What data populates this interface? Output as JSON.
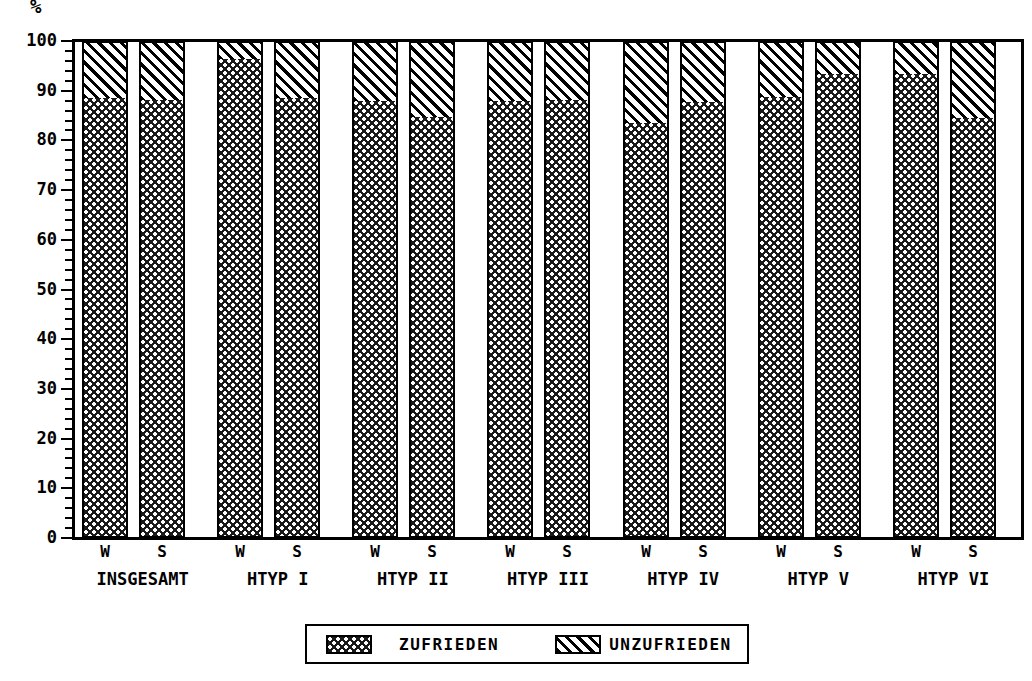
{
  "chart_data": {
    "type": "bar",
    "subtype": "stacked-100-percent",
    "title": "",
    "xlabel": "",
    "ylabel": "%",
    "ylim": [
      0,
      100
    ],
    "ytick_step": 10,
    "yminor_tick_step": 2,
    "ytick_labels": [
      "0",
      "10",
      "20",
      "30",
      "40",
      "50",
      "60",
      "70",
      "80",
      "90",
      "100"
    ],
    "grid": false,
    "legend_position": "bottom-center",
    "groups": [
      "INSGESAMT",
      "HTYP I",
      "HTYP II",
      "HTYP III",
      "HTYP IV",
      "HTYP V",
      "HTYP VI"
    ],
    "subcategories": [
      "W",
      "S"
    ],
    "categories": [
      "INSGESAMT W",
      "INSGESAMT S",
      "HTYP I W",
      "HTYP I S",
      "HTYP II W",
      "HTYP II S",
      "HTYP III W",
      "HTYP III S",
      "HTYP IV W",
      "HTYP IV S",
      "HTYP V W",
      "HTYP V S",
      "HTYP VI W",
      "HTYP VI S"
    ],
    "series": [
      {
        "name": "ZUFRIEDEN",
        "pattern": "checkered",
        "color": "#1a1a1a",
        "values": [
          88.5,
          88.2,
          96.3,
          88.5,
          88.0,
          84.7,
          88.0,
          88.2,
          83.5,
          87.8,
          88.8,
          93.3,
          93.4,
          84.6
        ]
      },
      {
        "name": "UNZUFRIEDEN",
        "pattern": "diagonal-hatch",
        "color": "#ffffff",
        "values": [
          11.5,
          11.8,
          3.7,
          11.5,
          12.0,
          15.3,
          12.0,
          11.8,
          16.5,
          12.2,
          11.2,
          6.7,
          6.6,
          15.4
        ]
      }
    ],
    "bars": [
      {
        "group": "INSGESAMT",
        "sub": "W",
        "zufrieden": 88.5,
        "unzufrieden": 11.5
      },
      {
        "group": "INSGESAMT",
        "sub": "S",
        "zufrieden": 88.2,
        "unzufrieden": 11.8
      },
      {
        "group": "HTYP I",
        "sub": "W",
        "zufrieden": 96.3,
        "unzufrieden": 3.7
      },
      {
        "group": "HTYP I",
        "sub": "S",
        "zufrieden": 88.5,
        "unzufrieden": 11.5
      },
      {
        "group": "HTYP II",
        "sub": "W",
        "zufrieden": 88.0,
        "unzufrieden": 12.0
      },
      {
        "group": "HTYP II",
        "sub": "S",
        "zufrieden": 84.7,
        "unzufrieden": 15.3
      },
      {
        "group": "HTYP III",
        "sub": "W",
        "zufrieden": 88.0,
        "unzufrieden": 12.0
      },
      {
        "group": "HTYP III",
        "sub": "S",
        "zufrieden": 88.2,
        "unzufrieden": 11.8
      },
      {
        "group": "HTYP IV",
        "sub": "W",
        "zufrieden": 83.5,
        "unzufrieden": 16.5
      },
      {
        "group": "HTYP IV",
        "sub": "S",
        "zufrieden": 87.8,
        "unzufrieden": 12.2
      },
      {
        "group": "HTYP V",
        "sub": "W",
        "zufrieden": 88.8,
        "unzufrieden": 11.2
      },
      {
        "group": "HTYP V",
        "sub": "S",
        "zufrieden": 93.3,
        "unzufrieden": 6.7
      },
      {
        "group": "HTYP VI",
        "sub": "W",
        "zufrieden": 93.4,
        "unzufrieden": 6.6
      },
      {
        "group": "HTYP VI",
        "sub": "S",
        "zufrieden": 84.6,
        "unzufrieden": 15.4
      }
    ],
    "legend": [
      {
        "label": "ZUFRIEDEN",
        "pattern": "checkered"
      },
      {
        "label": "UNZUFRIEDEN",
        "pattern": "diagonal-hatch"
      }
    ]
  },
  "axis": {
    "unit_label": "%"
  },
  "legend": {
    "zufrieden_label": "ZUFRIEDEN",
    "unzufrieden_label": "UNZUFRIEDEN"
  }
}
